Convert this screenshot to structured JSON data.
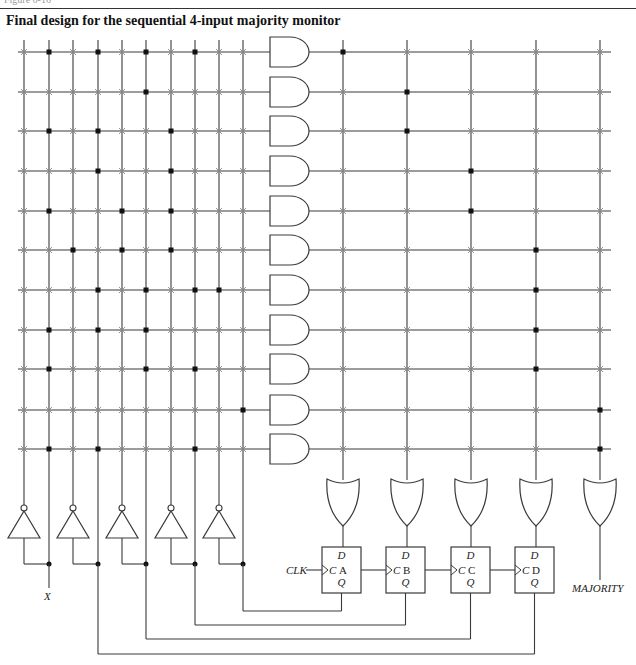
{
  "figure": {
    "caption_fragment": "Figure 6-16",
    "title": "Final design for the sequential 4-input majority monitor"
  },
  "colors": {
    "line": "#3a3a3a",
    "dot": "#111111",
    "cross": "#888888",
    "background": "#ffffff"
  },
  "and_matrix": {
    "input_columns_x": [
      24,
      49,
      73,
      98,
      122,
      146,
      171,
      195,
      219,
      243
    ],
    "product_rows_y": [
      52,
      92,
      131,
      171,
      211,
      250,
      290,
      330,
      369,
      410,
      449
    ],
    "connections": [
      [
        2,
        4,
        6,
        8
      ],
      [
        6
      ],
      [
        2,
        4,
        7
      ],
      [
        4,
        7
      ],
      [
        2,
        5,
        7
      ],
      [
        3,
        5,
        7
      ],
      [
        4,
        6,
        8,
        9
      ],
      [
        2,
        4,
        6
      ],
      [
        2,
        6,
        8
      ],
      [
        10
      ],
      [
        2,
        4,
        8
      ]
    ]
  },
  "or_matrix": {
    "output_columns_x": [
      343,
      407,
      471,
      536,
      600
    ],
    "connections_by_row": [
      1,
      2,
      2,
      3,
      3,
      4,
      4,
      4,
      4,
      5,
      5
    ]
  },
  "inverters": {
    "count": 5,
    "input_columns": [
      2,
      4,
      6,
      8,
      10
    ],
    "output_columns": [
      1,
      3,
      5,
      7,
      9
    ]
  },
  "flip_flops": [
    {
      "name": "A",
      "d_label": "D",
      "c_label": "C",
      "q_label": "Q"
    },
    {
      "name": "B",
      "d_label": "D",
      "c_label": "C",
      "q_label": "Q"
    },
    {
      "name": "C",
      "d_label": "D",
      "c_label": "C",
      "q_label": "Q"
    },
    {
      "name": "D",
      "d_label": "D",
      "c_label": "C",
      "q_label": "Q"
    }
  ],
  "labels": {
    "input": "X",
    "clock": "CLK",
    "output": "MAJORITY"
  }
}
